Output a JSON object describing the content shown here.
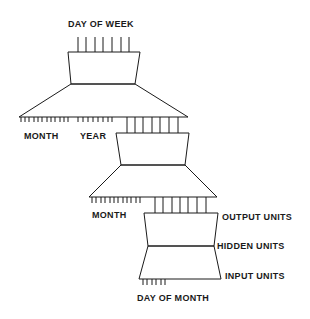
{
  "diagram": {
    "type": "hierarchical neural network",
    "stroke_color": "#1a1a1a",
    "background": "#ffffff",
    "networks": [
      {
        "id": "top",
        "output_label": "DAY OF WEEK",
        "output_count": 7,
        "input_groups": [
          {
            "label": "MONTH",
            "tick_count": 12
          },
          {
            "label": "YEAR",
            "tick_count": 8
          }
        ]
      },
      {
        "id": "middle",
        "output_count": 7,
        "input_groups": [
          {
            "label": "MONTH",
            "tick_count": 12
          }
        ]
      },
      {
        "id": "bottom",
        "output_count": 7,
        "layer_labels": {
          "output": "OUTPUT UNITS",
          "hidden": "HIDDEN UNITS",
          "input": "INPUT UNITS"
        },
        "input_groups": [
          {
            "label": "DAY OF MONTH",
            "tick_count": 6
          }
        ]
      }
    ]
  }
}
